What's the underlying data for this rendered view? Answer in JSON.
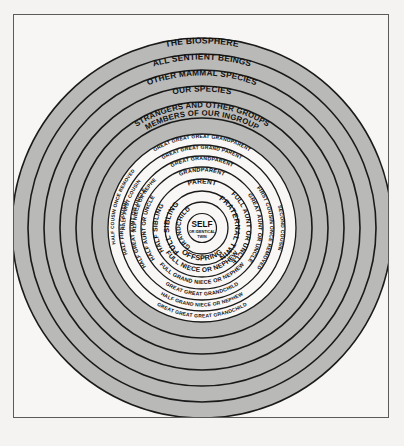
{
  "figure": {
    "title_visible": false,
    "colors": {
      "page_background": "#f4f3f1",
      "frame_border": "#5a5a58",
      "frame_fill": "#f7f6f4",
      "outer_ring_fill": "#b9b9b7",
      "inner_ring_fill": "#f8f7f5",
      "ring_stroke": "#1a1a1a",
      "text": "#111111"
    },
    "geometry": {
      "center_x": 202,
      "center_y": 228,
      "outer_radius": 190
    }
  },
  "center": {
    "line1": "SELF",
    "line2": "OR IDENTICAL",
    "line3": "TWIN"
  },
  "outer_rings": [
    {
      "index": 0,
      "label": "THE BIOSPHERE",
      "radius": 190,
      "fill": "#b9b9b7"
    },
    {
      "index": 1,
      "label": "ALL SENTIENT BEINGS",
      "radius": 174,
      "fill": "#b9b9b7"
    },
    {
      "index": 2,
      "label": "OTHER MAMMAL SPECIES",
      "radius": 158,
      "fill": "#b9b9b7"
    },
    {
      "index": 3,
      "label": "OUR SPECIES",
      "radius": 142,
      "fill": "#b9b9b7"
    },
    {
      "index": 4,
      "label": "STRANGERS AND OTHER GROUPS",
      "radius": 126,
      "fill": "#b9b9b7"
    },
    {
      "index": 5,
      "label": "MEMBERS OF OUR INGROUP",
      "radius": 110,
      "fill": "#b9b9b7"
    }
  ],
  "inner_rings": [
    {
      "index": 0,
      "radius": 94,
      "top": "GREAT GREAT GREAT GRANDPARENT",
      "bottom": "GREAT GREAT GREAT GRANDCHILD",
      "left": "",
      "right": ""
    },
    {
      "index": 1,
      "radius": 83,
      "top": "GREAT GREAT GRAND PARENT",
      "bottom": "HALF GRAND NIECE OR NEPHEW",
      "left": "HALF FIRST COUSIN",
      "right": "SECOND COUSIN"
    },
    {
      "index": 2,
      "radius": 72,
      "top": "GREAT GRANDPARENT",
      "bottom": "GREAT GREAT GRANDCHILD",
      "left": "HALF GREAT AUNT OR UNCLE",
      "right": "FIRST COUSIN ONCE REMOVED"
    },
    {
      "index": 3,
      "radius": 61,
      "top": "GRANDPARENT",
      "bottom": "FULL GRAND NIECE OR NEPHEW",
      "left": "HALF AUNT OR UNCLE",
      "right": "GREAT AUNT OR UNCLE"
    },
    {
      "index": 4,
      "radius": 49,
      "top": "PARENT",
      "bottom": "FULL NIECE OR NEPHEW",
      "left": "HALF SIBLING",
      "right": "FULL AUNT OR UNCLE"
    },
    {
      "index": 5,
      "radius": 37,
      "top": "",
      "bottom": "OFFSPRING",
      "left": "FULL SIBLING",
      "right": "FRATERNAL TWIN"
    },
    {
      "index": 6,
      "radius": 26,
      "top": "",
      "bottom": "",
      "left": "GRANDCHILD",
      "right": ""
    }
  ],
  "extra_labels": {
    "half_first_cousin": "HALF FIRST COUSIN",
    "half_cousin_once_removed": "HALF COUSIN ONCE REMOVED",
    "half_niece_or_nephew": "HALF NIECE OR NEPHEW",
    "first_cousin_once_removed": "FIRST COUSIN ONCE REMOVED"
  }
}
